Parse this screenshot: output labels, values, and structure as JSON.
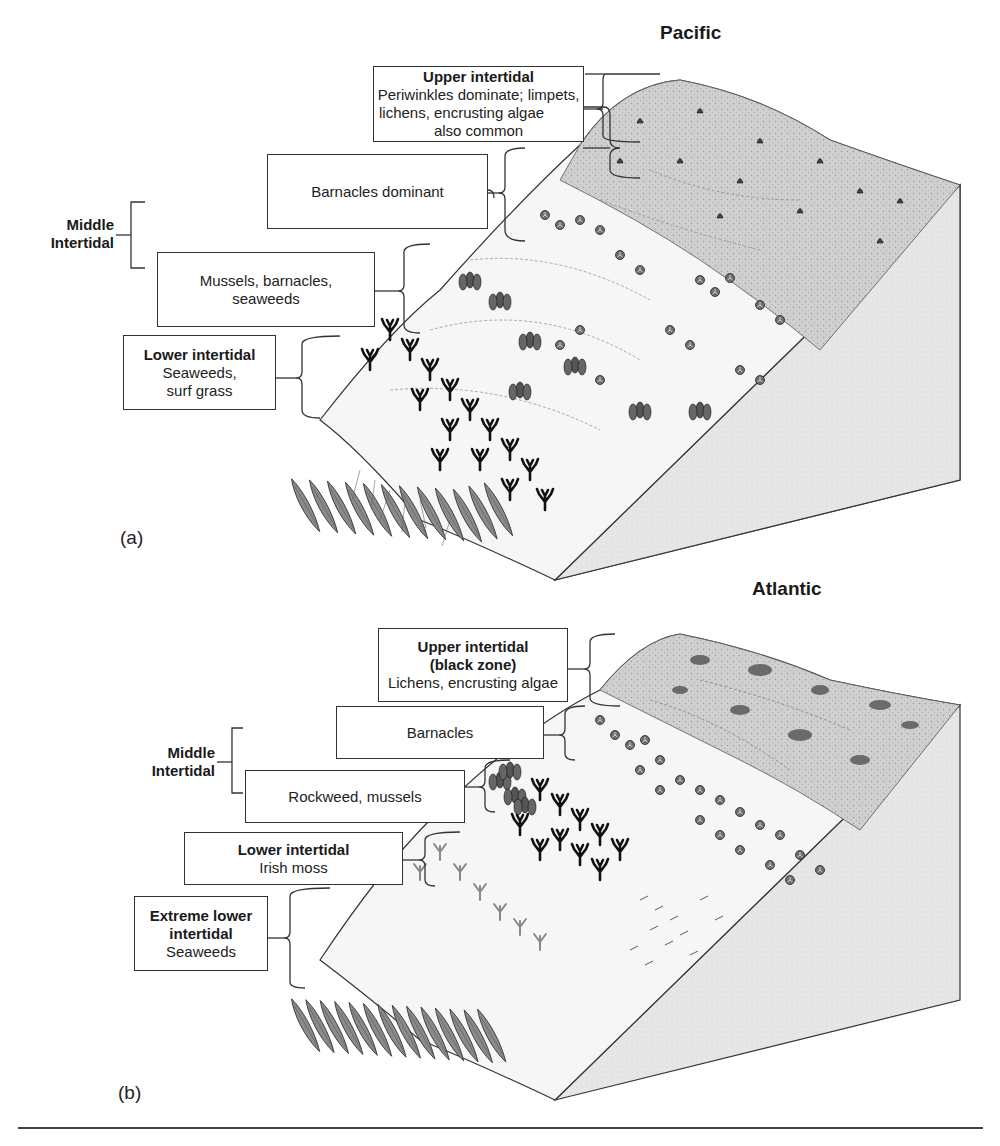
{
  "figure": {
    "panels": [
      {
        "id": "a",
        "tag": "(a)",
        "title": "Pacific",
        "zones": [
          {
            "key": "upper",
            "title": "Upper intertidal",
            "lines": [
              "Periwinkles dominate; limpets,",
              "lichens, encrusting algae",
              "also common"
            ]
          },
          {
            "key": "middle-1",
            "title": "",
            "lines": [
              "Barnacles dominant"
            ]
          },
          {
            "key": "middle-2",
            "title": "",
            "lines": [
              "Mussels, barnacles,",
              "seaweeds"
            ]
          },
          {
            "key": "lower",
            "title": "Lower intertidal",
            "lines": [
              "Seaweeds,",
              "surf grass"
            ]
          }
        ],
        "group_label": [
          "Middle",
          "Intertidal"
        ]
      },
      {
        "id": "b",
        "tag": "(b)",
        "title": "Atlantic",
        "zones": [
          {
            "key": "upper",
            "title_lines": [
              "Upper intertidal",
              "(black zone)"
            ],
            "lines": [
              "Lichens, encrusting algae"
            ]
          },
          {
            "key": "middle-1",
            "title": "",
            "lines": [
              "Barnacles"
            ]
          },
          {
            "key": "middle-2",
            "title": "",
            "lines": [
              "Rockweed, mussels"
            ]
          },
          {
            "key": "lower",
            "title": "Lower intertidal",
            "lines": [
              "Irish moss"
            ]
          },
          {
            "key": "extreme-lower",
            "title_lines": [
              "Extreme lower",
              "intertidal"
            ],
            "lines": [
              "Seaweeds"
            ]
          }
        ],
        "group_label": [
          "Middle",
          "Intertidal"
        ]
      }
    ],
    "colors": {
      "ink": "#222222",
      "rock_top": "#c8c8c8",
      "rock_side": "#e4e4e4",
      "seaweed": "#8a8a8a",
      "dark_weed": "#111111"
    }
  }
}
